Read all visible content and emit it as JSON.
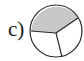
{
  "figure": {
    "label": "c)",
    "shape": "circle",
    "sections_total": 3,
    "sections_shaded": 1,
    "colors": {
      "shaded": "#c8c8c8",
      "unshaded": "#ffffff",
      "stroke": "#2a2a2a"
    }
  }
}
